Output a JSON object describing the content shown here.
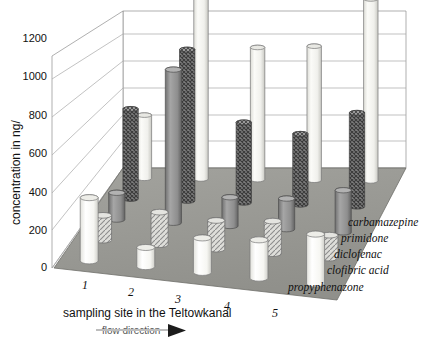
{
  "chart_data": {
    "type": "bar",
    "subtype": "3d-grouped-cylinder",
    "title": "",
    "xlabel": "sampling site in the Teltowkanal",
    "ylabel": "concentration in ng/",
    "zlabel": "",
    "ylim": [
      0,
      1300
    ],
    "yticks": [
      0,
      200,
      400,
      600,
      800,
      1000,
      1200
    ],
    "ytick_labels": [
      "0",
      "200",
      "400",
      "600",
      "800",
      "1000",
      "1200"
    ],
    "categories": [
      "1",
      "2",
      "3",
      "4",
      "5"
    ],
    "grid": true,
    "legend_position": "right-floor",
    "annotations": [
      "flow direction"
    ],
    "series": [
      {
        "name": "carbamazepine",
        "values": [
          330,
          1270,
          690,
          700,
          950
        ],
        "fill": "light",
        "color": "#f2f2ef"
      },
      {
        "name": "primidone",
        "values": [
          470,
          790,
          420,
          370,
          490
        ],
        "fill": "crosshatch-dark",
        "color": "#6e6e6e"
      },
      {
        "name": "diclofenac",
        "values": [
          140,
          800,
          150,
          160,
          220
        ],
        "fill": "solid-gray",
        "color": "#8f8f8f"
      },
      {
        "name": "clofibric acid",
        "values": [
          130,
          170,
          150,
          170,
          120
        ],
        "fill": "hatch-light",
        "color": "#c8c8c4"
      },
      {
        "name": "propyphenazone",
        "values": [
          330,
          100,
          180,
          200,
          260
        ],
        "fill": "white",
        "color": "#fafaf7"
      }
    ]
  },
  "axes": {
    "y_title": "concentration in ng/",
    "x_title": "sampling site in the Teltowkanal",
    "flow_label": "flow direction"
  },
  "legend": {
    "items": [
      {
        "label": "carbamazepine"
      },
      {
        "label": "primidone"
      },
      {
        "label": "diclofenac"
      },
      {
        "label": "clofibric acid"
      },
      {
        "label": "propyphenazone"
      }
    ]
  },
  "colors": {
    "floor": "#9a9a95",
    "wall": "#ffffff",
    "grid": "#9a9a95",
    "outline": "#4a4a4a"
  }
}
